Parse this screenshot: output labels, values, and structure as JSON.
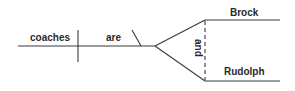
{
  "diagram": {
    "type": "sentence-diagram",
    "subject": "coaches",
    "verb": "are",
    "conjunction": "and",
    "compound_complement": [
      "Brock",
      "Rudolph"
    ],
    "line_color": "#3a3a3a",
    "text_color": "#2a2a2a"
  }
}
